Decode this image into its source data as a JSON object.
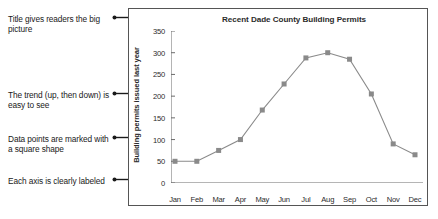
{
  "annotations": [
    {
      "text": "Title gives readers the big picture"
    },
    {
      "text": "The trend (up, then down) is easy to see"
    },
    {
      "text": "Data points are marked with a square shape"
    },
    {
      "text": "Each axis is clearly labeled"
    }
  ],
  "colors": {
    "line": "#8a8a8a",
    "marker": "#8a8a8a",
    "axis": "#6b6b6b",
    "frame": "#555555",
    "text": "#1a1a1a"
  },
  "chart_data": {
    "type": "line",
    "title": "Recent Dade County Building Permits",
    "xlabel": "",
    "ylabel": "Building permits issued last year",
    "categories": [
      "Jan",
      "Feb",
      "Mar",
      "Apr",
      "May",
      "Jun",
      "Jul",
      "Aug",
      "Sep",
      "Oct",
      "Nov",
      "Dec"
    ],
    "values": [
      50,
      50,
      75,
      100,
      168,
      228,
      288,
      300,
      285,
      205,
      90,
      65
    ],
    "series": [
      {
        "name": "Building permits issued last year",
        "values": [
          50,
          50,
          75,
          100,
          168,
          228,
          288,
          300,
          285,
          205,
          90,
          65
        ]
      }
    ],
    "ylim": [
      0,
      350
    ],
    "yticks": [
      0,
      50,
      100,
      150,
      200,
      250,
      300,
      350
    ],
    "ytick_labels": [
      "0",
      "50",
      "100",
      "150",
      "200",
      "250",
      "300",
      "350"
    ],
    "grid": false,
    "legend": false,
    "marker": "square"
  }
}
